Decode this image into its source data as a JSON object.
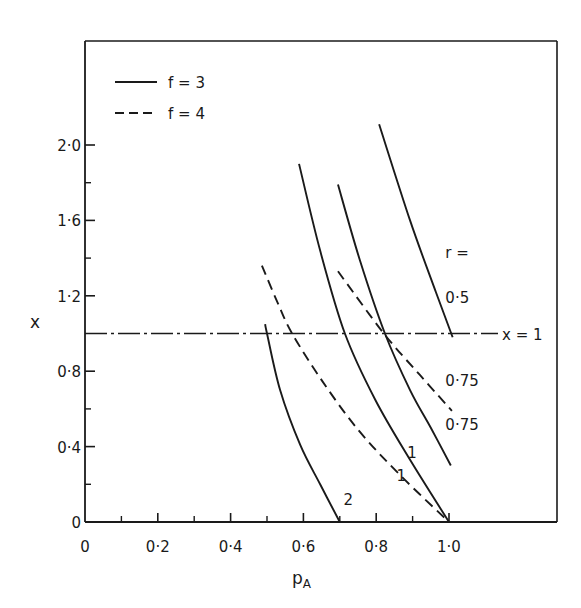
{
  "chart_data": {
    "type": "line",
    "title": "",
    "xlabel": "p",
    "xlabel_sub": "A",
    "ylabel": "x",
    "xlim": [
      0,
      1.2
    ],
    "ylim": [
      0,
      2.3
    ],
    "grid": false,
    "legend_position": "upper-left",
    "x_ticks": [
      {
        "value": 0,
        "label": "0"
      },
      {
        "value": 0.2,
        "label": "0·2"
      },
      {
        "value": 0.4,
        "label": "0·4"
      },
      {
        "value": 0.6,
        "label": "0·6"
      },
      {
        "value": 0.8,
        "label": "0·8"
      },
      {
        "value": 1.0,
        "label": "1·0"
      }
    ],
    "x_minor_ticks": [
      0.1,
      0.3,
      0.5,
      0.7,
      0.9
    ],
    "y_ticks": [
      {
        "value": 0,
        "label": "0"
      },
      {
        "value": 0.4,
        "label": "0·4"
      },
      {
        "value": 0.8,
        "label": "0·8"
      },
      {
        "value": 1.2,
        "label": "1·2"
      },
      {
        "value": 1.6,
        "label": "1·6"
      },
      {
        "value": 2.0,
        "label": "2·0"
      }
    ],
    "y_minor_ticks": [
      0.2,
      0.6,
      1.0,
      1.4,
      1.8
    ],
    "legend": [
      {
        "label": "f = 3",
        "style": "solid"
      },
      {
        "label": "f = 4",
        "style": "dashed"
      }
    ],
    "reference_line": {
      "y": 1.0,
      "label": "x = 1",
      "style": "dashdot"
    },
    "r_header": "r =",
    "series": [
      {
        "name": "f=3, r=2",
        "f": 3,
        "r": 2,
        "style": "solid",
        "label": "2",
        "x": [
          0.495,
          0.5,
          0.536,
          0.591,
          0.646,
          0.7
        ],
        "y": [
          1.05,
          1.0,
          0.7,
          0.41,
          0.2,
          0.0
        ]
      },
      {
        "name": "f=4, r=1",
        "f": 4,
        "r": 1,
        "style": "dashed",
        "label": "1",
        "x": [
          0.486,
          0.53,
          0.569,
          0.651,
          0.75,
          0.865,
          1.0
        ],
        "y": [
          1.36,
          1.16,
          1.0,
          0.75,
          0.49,
          0.25,
          0.0
        ]
      },
      {
        "name": "f=3, r=1",
        "f": 3,
        "r": 1,
        "style": "solid",
        "label": "1",
        "x": [
          0.588,
          0.646,
          0.714,
          0.797,
          0.893,
          1.0
        ],
        "y": [
          1.9,
          1.44,
          1.0,
          0.65,
          0.33,
          0.0
        ]
      },
      {
        "name": "f=3, r=0.75",
        "f": 3,
        "r": 0.75,
        "style": "solid",
        "label": "0·75",
        "x": [
          0.695,
          0.755,
          0.824,
          0.893,
          0.95,
          1.005
        ],
        "y": [
          1.79,
          1.39,
          1.0,
          0.7,
          0.5,
          0.3
        ]
      },
      {
        "name": "f=4, r=0.75",
        "f": 4,
        "r": 0.75,
        "style": "dashed",
        "label": "0·75",
        "x": [
          0.695,
          0.821,
          0.92,
          1.008
        ],
        "y": [
          1.33,
          1.0,
          0.78,
          0.59
        ]
      },
      {
        "name": "f=3, r=0.5",
        "f": 3,
        "r": 0.5,
        "style": "solid",
        "label": "0·5",
        "x": [
          0.808,
          0.893,
          0.962,
          1.01
        ],
        "y": [
          2.11,
          1.6,
          1.23,
          0.98
        ]
      }
    ],
    "label_positions": [
      {
        "text": "2",
        "x": 0.71,
        "y": 0.09
      },
      {
        "text": "1",
        "x": 0.856,
        "y": 0.22
      },
      {
        "text": "1",
        "x": 0.885,
        "y": 0.34
      },
      {
        "text": "0·75",
        "x": 0.99,
        "y": 0.49
      },
      {
        "text": "0·75",
        "x": 0.99,
        "y": 0.72
      },
      {
        "text": "0·5",
        "x": 0.99,
        "y": 1.16
      },
      {
        "text": "r =",
        "x": 0.99,
        "y": 1.4
      }
    ]
  }
}
